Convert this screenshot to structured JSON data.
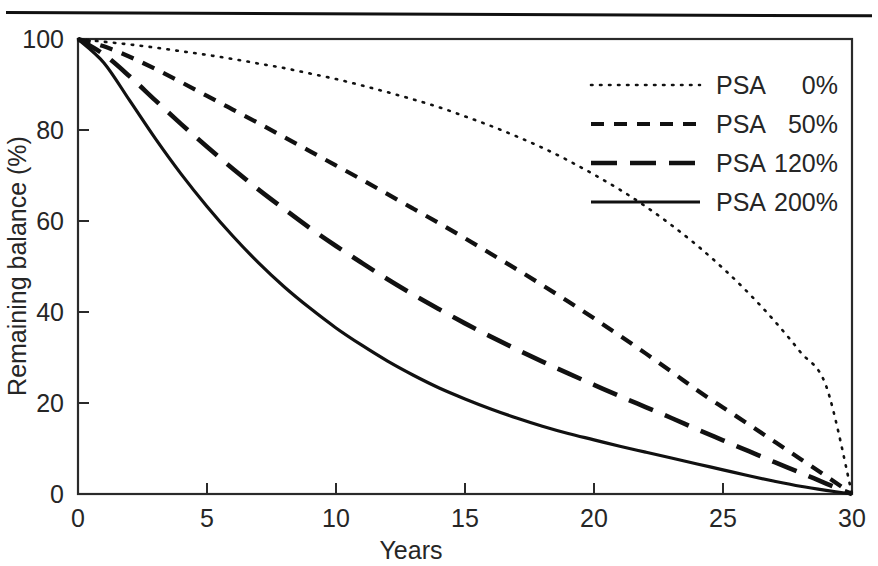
{
  "figure": {
    "top_rule": "horizontal-rule"
  },
  "chart_data": {
    "type": "line",
    "title": "",
    "xlabel": "Years",
    "ylabel": "Remaining balance (%)",
    "xlim": [
      0,
      30
    ],
    "ylim": [
      0,
      100
    ],
    "xticks": [
      0,
      5,
      10,
      15,
      20,
      25,
      30
    ],
    "yticks": [
      0,
      20,
      40,
      60,
      80,
      100
    ],
    "xtick_labels": [
      "0",
      "5",
      "10",
      "15",
      "20",
      "25",
      "30"
    ],
    "ytick_labels": [
      "0",
      "20",
      "40",
      "60",
      "80",
      "100"
    ],
    "grid": false,
    "legend_position": "upper right",
    "x": [
      0,
      1,
      2,
      3,
      4,
      5,
      6,
      7,
      8,
      9,
      10,
      11,
      12,
      13,
      14,
      15,
      16,
      17,
      18,
      19,
      20,
      21,
      22,
      23,
      24,
      25,
      26,
      27,
      28,
      29,
      30
    ],
    "series": [
      {
        "name": "PSA   0%",
        "label_prefix": "PSA",
        "label_value": "0%",
        "style": "dotted",
        "color": "#111111",
        "values": [
          100.0,
          99.4,
          98.8,
          98.1,
          97.3,
          96.5,
          95.6,
          94.6,
          93.6,
          92.4,
          91.2,
          89.8,
          88.3,
          86.7,
          85.0,
          83.0,
          80.9,
          78.6,
          76.1,
          73.3,
          70.2,
          66.9,
          63.2,
          59.1,
          54.6,
          49.6,
          44.1,
          38.0,
          31.2,
          23.7,
          0.0
        ]
      },
      {
        "name": "PSA  50%",
        "label_prefix": "PSA",
        "label_value": "50%",
        "style": "dashed",
        "color": "#111111",
        "values": [
          100.0,
          98.4,
          96.1,
          93.4,
          90.5,
          87.5,
          84.5,
          81.5,
          78.4,
          75.3,
          72.2,
          69.1,
          65.9,
          62.7,
          59.5,
          56.2,
          52.8,
          49.4,
          45.9,
          42.3,
          38.6,
          34.8,
          30.9,
          26.9,
          22.8,
          19.0,
          15.3,
          11.5,
          7.7,
          3.9,
          0.0
        ]
      },
      {
        "name": "PSA 120%",
        "label_prefix": "PSA",
        "label_value": "120%",
        "style": "long-dashed",
        "color": "#111111",
        "values": [
          100.0,
          96.6,
          91.8,
          86.5,
          81.3,
          76.3,
          71.5,
          66.9,
          62.6,
          58.4,
          54.5,
          50.8,
          47.2,
          43.8,
          40.6,
          37.5,
          34.6,
          31.8,
          29.1,
          26.5,
          24.0,
          21.5,
          19.1,
          16.7,
          14.2,
          11.8,
          9.4,
          7.0,
          4.7,
          2.3,
          0.0
        ]
      },
      {
        "name": "PSA 200%",
        "label_prefix": "PSA",
        "label_value": "200%",
        "style": "solid",
        "color": "#111111",
        "values": [
          100.0,
          94.8,
          86.5,
          78.1,
          70.3,
          63.2,
          56.7,
          50.8,
          45.5,
          40.8,
          36.5,
          32.7,
          29.2,
          26.1,
          23.3,
          20.9,
          18.7,
          16.7,
          14.9,
          13.3,
          11.9,
          10.5,
          9.2,
          7.9,
          6.6,
          5.3,
          4.0,
          2.8,
          1.7,
          0.8,
          0.0
        ]
      }
    ]
  }
}
